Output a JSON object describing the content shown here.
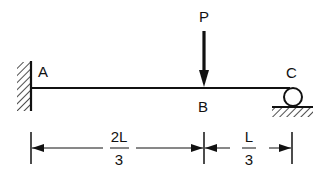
{
  "diagram": {
    "type": "beam",
    "labels": {
      "support_left": "A",
      "load_point": "B",
      "support_right": "C",
      "load": "P"
    },
    "dimensions": {
      "left_span": {
        "numerator": "2L",
        "denominator": "3"
      },
      "right_span": {
        "numerator": "L",
        "denominator": "3"
      }
    },
    "supports": {
      "left": "fixed wall",
      "right": "roller"
    }
  }
}
